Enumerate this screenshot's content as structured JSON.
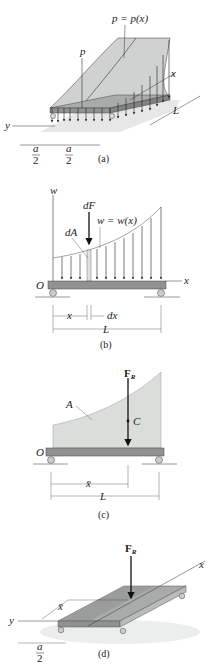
{
  "colors": {
    "load_surface": "#cfd2d0",
    "load_surface_dark": "#b8bcba",
    "beam": "#8e9290",
    "beam_top": "#a7aba9",
    "area_fill": "#d9dedb",
    "ground_shadow": "#d6d8d7",
    "line": "#333333"
  },
  "figure_a": {
    "caption": "(a)",
    "load_label": "p = p(x)",
    "axis_p": "p",
    "axis_x": "x",
    "axis_y": "y",
    "dim_L": "L",
    "dim_a_num_1": "a",
    "dim_a_den_1": "2",
    "dim_a_num_2": "a",
    "dim_a_den_2": "2"
  },
  "figure_b": {
    "caption": "(b)",
    "axis_w": "w",
    "axis_x": "x",
    "origin": "O",
    "force_label": "dF",
    "load_label": "w = w(x)",
    "area_label": "dA",
    "dim_x": "x",
    "dim_dx": "dx",
    "dim_L": "L"
  },
  "figure_c": {
    "caption": "(c)",
    "resultant_label": "F",
    "resultant_sub": "R",
    "area_label": "A",
    "centroid_label": "C",
    "origin": "O",
    "axis_x": "x",
    "dim_xbar": "x̄",
    "dim_L": "L"
  },
  "figure_d": {
    "caption": "(d)",
    "resultant_label": "F",
    "resultant_sub": "R",
    "axis_x": "x",
    "axis_y": "y",
    "dim_xbar": "x̄",
    "dim_a_num": "a",
    "dim_a_den": "2"
  }
}
